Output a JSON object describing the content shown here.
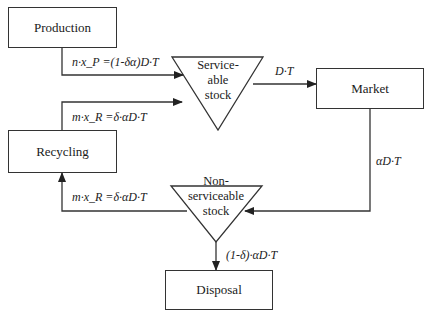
{
  "nodes": {
    "production": {
      "label": "Production"
    },
    "market": {
      "label": "Market"
    },
    "recycling": {
      "label": "Recycling"
    },
    "disposal": {
      "label": "Disposal"
    },
    "serviceable_stock": {
      "line1": "Service-",
      "line2": "able",
      "line3": "stock"
    },
    "nonserviceable_stock": {
      "line1": "Non-",
      "line2": "serviceable",
      "line3": "stock"
    }
  },
  "flows": {
    "production_to_serviceable": "n·x_P =(1-δα)D·T",
    "recycling_to_serviceable": "m·x_R =δ·αD·T",
    "serviceable_to_market": "D·T",
    "market_to_nonserviceable": "αD·T",
    "nonserviceable_to_recycling": "m·x_R =δ·αD·T",
    "nonserviceable_to_disposal": "(1-δ)·αD·T"
  },
  "colors": {
    "line": "#333333",
    "background": "#ffffff"
  }
}
